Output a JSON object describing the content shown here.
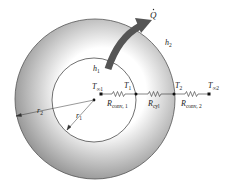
{
  "diagram": {
    "colors": {
      "shell_light": "#ffffff",
      "shell_dark": "#8c8c8c",
      "arrow": "#555555",
      "line": "#333333",
      "inner": "#ffffff"
    },
    "labels": {
      "heat_flow": "Q",
      "h_outer": "h",
      "h_outer_sub": "2",
      "h_inner": "h",
      "h_inner_sub": "1",
      "T_inf1": "T",
      "T_inf1_sub": "∞1",
      "T1": "T",
      "T1_sub": "1",
      "T2": "T",
      "T2_sub": "2",
      "T_inf2": "T",
      "T_inf2_sub": "∞2",
      "R_conv1": "R",
      "R_conv1_sub": "conv, 1",
      "R_cyl": "R",
      "R_cyl_sub": "cyl",
      "R_conv2": "R",
      "R_conv2_sub": "conv, 2",
      "r1": "r",
      "r1_sub": "1",
      "r2": "r",
      "r2_sub": "2"
    },
    "nodes": [
      "T∞1",
      "T1",
      "T2",
      "T∞2"
    ],
    "resistances": [
      "Rconv,1",
      "Rcyl",
      "Rconv,2"
    ]
  }
}
